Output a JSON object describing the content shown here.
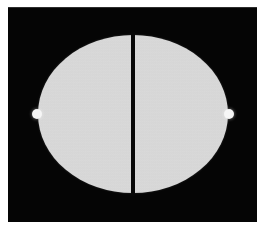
{
  "figure": {
    "caption": "Figure 4. Reconstructed image of the split-disc phantom.",
    "background_color": "#ffffff",
    "plate_color": "#050505",
    "disc_color": "#dedede",
    "marker_color": "#f6f6f6",
    "septum_color": "#070707",
    "disc_label": "split-disc phantom",
    "left_half_label": "left half-disc",
    "right_half_label": "right half-disc",
    "septum_label": "central gap",
    "marker_left_label": "left marker bead",
    "marker_right_label": "right marker bead"
  },
  "chart_data": {
    "type": "heatmap",
    "xlabel": "",
    "ylabel": "",
    "grid": false,
    "legend": "none",
    "colorscale": "grayscale",
    "value_range": [
      0,
      255
    ],
    "background_value": 5,
    "objects": [
      {
        "name": "left half-disc",
        "shape": "half-ellipse",
        "center_x": 86,
        "center_y": 114,
        "radius_x": 48,
        "radius_y": 79,
        "intensity": 222
      },
      {
        "name": "right half-disc",
        "shape": "half-ellipse",
        "center_x": 172,
        "center_y": 114,
        "radius_x": 48,
        "radius_y": 79,
        "intensity": 222
      },
      {
        "name": "central gap",
        "shape": "vertical-band",
        "center_x": 134,
        "width": 4,
        "intensity": 7
      },
      {
        "name": "left marker bead",
        "shape": "circle",
        "center_x": 33,
        "center_y": 114,
        "radius": 5,
        "intensity": 246
      },
      {
        "name": "right marker bead",
        "shape": "circle",
        "center_x": 235,
        "center_y": 114,
        "radius": 5,
        "intensity": 246
      }
    ],
    "image_extent": {
      "x_min": 8,
      "x_max": 257,
      "y_min": 7,
      "y_max": 222
    }
  }
}
